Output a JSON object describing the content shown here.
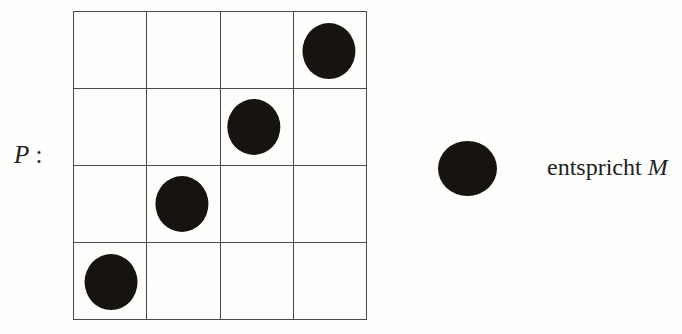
{
  "figure": {
    "kind": "permutation-matrix-diagram",
    "background_color": "#fdfdfc",
    "ink_color": "#17140f",
    "rule_color": "#4a4a4a"
  },
  "matrix": {
    "label_symbol": "P",
    "label_separator": " :",
    "rows": 4,
    "columns": 4,
    "marker_shape": "filled-circle",
    "occupied_cells": [
      {
        "row": 1,
        "column": 4
      },
      {
        "row": 2,
        "column": 3
      },
      {
        "row": 3,
        "column": 2
      },
      {
        "row": 4,
        "column": 1
      }
    ],
    "cells": [
      [
        {
          "row": 1,
          "column": 1,
          "filled": false
        },
        {
          "row": 1,
          "column": 2,
          "filled": false
        },
        {
          "row": 1,
          "column": 3,
          "filled": false
        },
        {
          "row": 1,
          "column": 4,
          "filled": true
        }
      ],
      [
        {
          "row": 2,
          "column": 1,
          "filled": false
        },
        {
          "row": 2,
          "column": 2,
          "filled": false
        },
        {
          "row": 2,
          "column": 3,
          "filled": true
        },
        {
          "row": 2,
          "column": 4,
          "filled": false
        }
      ],
      [
        {
          "row": 3,
          "column": 1,
          "filled": false
        },
        {
          "row": 3,
          "column": 2,
          "filled": true
        },
        {
          "row": 3,
          "column": 3,
          "filled": false
        },
        {
          "row": 3,
          "column": 4,
          "filled": false
        }
      ],
      [
        {
          "row": 4,
          "column": 1,
          "filled": true
        },
        {
          "row": 4,
          "column": 2,
          "filled": false
        },
        {
          "row": 4,
          "column": 3,
          "filled": false
        },
        {
          "row": 4,
          "column": 4,
          "filled": false
        }
      ]
    ]
  },
  "legend": {
    "marker_shape": "filled-circle",
    "text_plain": "entspricht",
    "text_symbol": "M"
  }
}
